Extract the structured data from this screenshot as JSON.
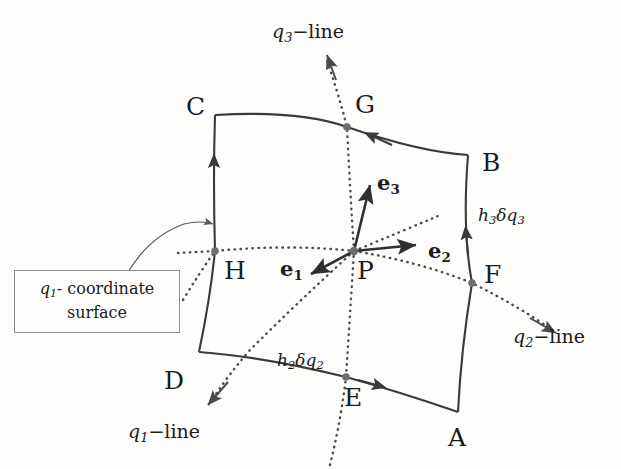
{
  "figure": {
    "background_color": "#fdfdfc",
    "ink_color": "#1b1b1b",
    "line_color": "#3a3a3a",
    "node_color": "#6d6d6d"
  },
  "callout": {
    "symbol": "q",
    "subscript": "1",
    "text_line1": "- coordinate",
    "text_line2": "surface"
  },
  "points": [
    {
      "name": "A",
      "label": "A",
      "x": 458,
      "y": 412,
      "kind": "corner"
    },
    {
      "name": "B",
      "label": "B",
      "x": 468,
      "y": 155,
      "kind": "corner"
    },
    {
      "name": "C",
      "label": "C",
      "x": 215,
      "y": 115,
      "kind": "corner"
    },
    {
      "name": "D",
      "label": "D",
      "x": 199,
      "y": 352,
      "kind": "corner"
    },
    {
      "name": "E",
      "label": "E",
      "x": 346,
      "y": 377,
      "kind": "edge-mid"
    },
    {
      "name": "F",
      "label": "F",
      "x": 472,
      "y": 283,
      "kind": "edge-mid"
    },
    {
      "name": "G",
      "label": "G",
      "x": 347,
      "y": 127,
      "kind": "edge-mid"
    },
    {
      "name": "H",
      "label": "H",
      "x": 215,
      "y": 251,
      "kind": "edge-mid"
    },
    {
      "name": "P",
      "label": "P",
      "x": 354,
      "y": 251,
      "kind": "center"
    }
  ],
  "coordinate_lines": [
    {
      "name": "q1-line",
      "symbol": "q",
      "subscript": "1",
      "suffix": "−line",
      "label_x": 128,
      "label_y": 422
    },
    {
      "name": "q2-line",
      "symbol": "q",
      "subscript": "2",
      "suffix": "−line",
      "label_x": 513,
      "label_y": 327
    },
    {
      "name": "q3-line",
      "symbol": "q",
      "subscript": "3",
      "suffix": "−line",
      "label_x": 272,
      "label_y": 22
    }
  ],
  "metrics": [
    {
      "name": "h3dq3",
      "symbol_h": "h",
      "sub_h": "3",
      "symbol_d": "δq",
      "sub_d": "3",
      "label_x": 478,
      "label_y": 207
    },
    {
      "name": "h2dq2",
      "symbol_h": "h",
      "sub_h": "2",
      "symbol_d": "δq",
      "sub_d": "2",
      "label_x": 277,
      "label_y": 352
    }
  ],
  "basis_vectors": [
    {
      "name": "e1",
      "symbol": "e",
      "subscript": "1",
      "label_x": 280,
      "label_y": 258,
      "direction": "down-left"
    },
    {
      "name": "e2",
      "symbol": "e",
      "subscript": "2",
      "label_x": 428,
      "label_y": 240,
      "direction": "right"
    },
    {
      "name": "e3",
      "symbol": "e",
      "subscript": "3",
      "label_x": 377,
      "label_y": 172,
      "direction": "up"
    }
  ]
}
